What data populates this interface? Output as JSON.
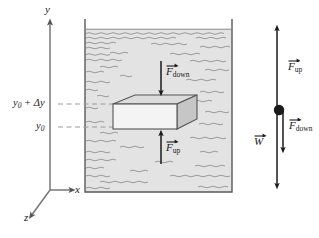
{
  "figure": {
    "type": "physics-diagram"
  },
  "axes": {
    "y_label": "y",
    "x_label": "x",
    "z_label": "z"
  },
  "height_markers": [
    {
      "id": "upper",
      "base": "y",
      "subscript": "0",
      "suffix": " + Δy",
      "full": "y0 + Δy"
    },
    {
      "id": "lower",
      "base": "y",
      "subscript": "0",
      "suffix": "",
      "full": "y0"
    }
  ],
  "tank": {
    "fill_color": "#e3e3e3",
    "wall_color": "#5a5a5a",
    "hatch_color": "#8a8a8a"
  },
  "block": {
    "face_color": "#f2f2f2",
    "top_color": "#dcdcdc",
    "side_color": "#c8c8c8",
    "edge_color": "#555555"
  },
  "forces_in_tank": [
    {
      "id": "f-down-tank",
      "base": "F",
      "subscript": "down",
      "direction": "down"
    },
    {
      "id": "f-up-tank",
      "base": "F",
      "subscript": "up",
      "direction": "up"
    }
  ],
  "free_body": {
    "dot_color": "#1a1a1a",
    "forces": [
      {
        "id": "f-up-fbd",
        "base": "F",
        "subscript": "up",
        "direction": "up"
      },
      {
        "id": "f-down-fbd",
        "base": "F",
        "subscript": "down",
        "direction": "down"
      },
      {
        "id": "w-fbd",
        "base": "W",
        "subscript": "",
        "direction": "down"
      }
    ]
  }
}
